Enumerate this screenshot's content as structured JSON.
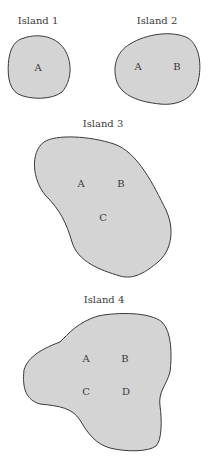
{
  "diagram": {
    "colors": {
      "island_fill": "#d4d4d4",
      "outline": "#3a3a3a",
      "background": "#ffffff",
      "text": "#3a3a3a"
    },
    "islands": [
      {
        "title": "Island 1",
        "sites": [
          "A"
        ]
      },
      {
        "title": "Island 2",
        "sites": [
          "A",
          "B"
        ]
      },
      {
        "title": "Island 3",
        "sites": [
          "A",
          "B",
          "C"
        ]
      },
      {
        "title": "Island 4",
        "sites": [
          "A",
          "B",
          "C",
          "D"
        ]
      }
    ]
  }
}
